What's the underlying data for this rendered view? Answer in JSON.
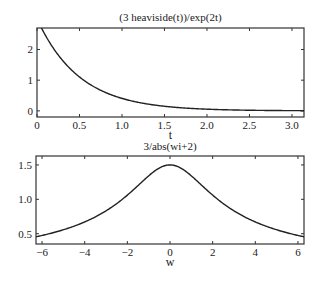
{
  "chart_data": [
    {
      "type": "line",
      "title": "(3 heaviside(t))/exp(2t)",
      "xlabel": "t",
      "ylabel": "",
      "xlim": [
        0,
        3.1416
      ],
      "ylim": [
        -0.2,
        2.7
      ],
      "xticks": [
        0,
        0.5,
        1.0,
        1.5,
        2.0,
        2.5,
        3.0
      ],
      "xtick_labels": [
        "0",
        "0.5",
        "1.0",
        "1.5",
        "2.0",
        "2.5",
        "3.0"
      ],
      "yticks": [
        0,
        1,
        2
      ],
      "ytick_labels": [
        "0",
        "1",
        "2"
      ],
      "grid": false,
      "series": [
        {
          "name": "3*exp(-2t)",
          "x": [
            0,
            0.25,
            0.5,
            0.75,
            1.0,
            1.5,
            2.0,
            2.5,
            3.0,
            3.14
          ],
          "values": [
            3.0,
            1.82,
            1.1,
            0.67,
            0.41,
            0.15,
            0.05,
            0.02,
            0.007,
            0.006
          ]
        }
      ]
    },
    {
      "type": "line",
      "title": "3/abs(wi+2)",
      "xlabel": "w",
      "ylabel": "",
      "xlim": [
        -6.2832,
        6.2832
      ],
      "ylim": [
        0.35,
        1.63
      ],
      "xticks": [
        -6,
        -4,
        -2,
        0,
        2,
        4,
        6
      ],
      "xtick_labels": [
        "-6",
        "-4",
        "-2",
        "0",
        "2",
        "4",
        "6"
      ],
      "yticks": [
        0.5,
        1.0,
        1.5
      ],
      "ytick_labels": [
        "0.5",
        "1.0",
        "1.5"
      ],
      "grid": false,
      "series": [
        {
          "name": "3/sqrt(w^2+4)",
          "x": [
            -6.28,
            -4,
            -2,
            0,
            2,
            4,
            6.28
          ],
          "values": [
            0.455,
            0.671,
            1.061,
            1.5,
            1.061,
            0.671,
            0.455
          ]
        }
      ]
    }
  ]
}
